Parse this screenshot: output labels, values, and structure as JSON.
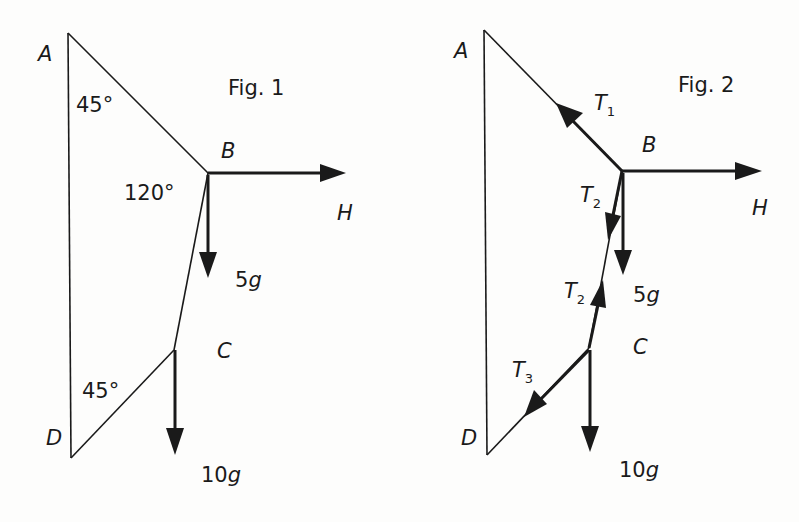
{
  "figures": [
    {
      "title": "Fig. 1",
      "points": {
        "A": "A",
        "B": "B",
        "C": "C",
        "D": "D"
      },
      "angles": {
        "at_A": "45°",
        "at_B": "120°",
        "at_D": "45°"
      },
      "forces": {
        "horizontal": "H",
        "weight_B_num": "5",
        "weight_B_g": "g",
        "weight_C_num": "10",
        "weight_C_g": "g"
      }
    },
    {
      "title": "Fig. 2",
      "points": {
        "A": "A",
        "B": "B",
        "C": "C",
        "D": "D"
      },
      "tensions": {
        "T1": {
          "T": "T",
          "sub": "1"
        },
        "T2_top": {
          "T": "T",
          "sub": "2"
        },
        "T2_bottom": {
          "T": "T",
          "sub": "2"
        },
        "T3": {
          "T": "T",
          "sub": "3"
        }
      },
      "forces": {
        "horizontal": "H",
        "weight_B_num": "5",
        "weight_B_g": "g",
        "weight_C_num": "10",
        "weight_C_g": "g"
      }
    }
  ]
}
